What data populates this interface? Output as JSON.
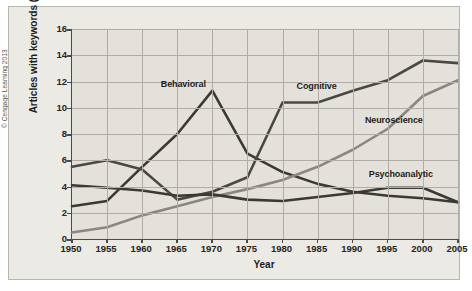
{
  "figure": {
    "copyright": "© Cengage Learning 2013",
    "background_color": "#eceae5",
    "plot_background_color": "#e4e1db",
    "grid_color": "#b0ada7",
    "axis_color": "#4d4a45"
  },
  "chart_data": {
    "type": "line",
    "title": "",
    "xlabel": "Year",
    "ylabel": "Articles with keywords (%)",
    "x": [
      1950,
      1955,
      1960,
      1965,
      1970,
      1975,
      1980,
      1985,
      1990,
      1995,
      2000,
      2005
    ],
    "xlim": [
      1950,
      2005
    ],
    "ylim": [
      0,
      16
    ],
    "yticks": [
      0,
      2,
      4,
      6,
      8,
      10,
      12,
      14,
      16
    ],
    "xticks": [
      1950,
      1955,
      1960,
      1965,
      1970,
      1975,
      1980,
      1985,
      1990,
      1995,
      2000,
      2005
    ],
    "grid": true,
    "legend_position": "inline-annotations",
    "series": [
      {
        "name": "Behavioral",
        "color": "#3b3936",
        "values": [
          2.5,
          2.9,
          5.5,
          8.0,
          11.3,
          6.5,
          5.1,
          4.2,
          3.6,
          3.3,
          3.1,
          2.8
        ],
        "label_x": 1966,
        "label_y": 11.7
      },
      {
        "name": "Cognitive",
        "color": "#4a4845",
        "values": [
          5.5,
          6.0,
          5.3,
          3.0,
          3.6,
          4.7,
          10.4,
          10.4,
          11.3,
          12.1,
          13.6,
          13.4
        ],
        "label_x": 1985,
        "label_y": 11.6
      },
      {
        "name": "Neuroscience",
        "color": "#8a8780",
        "values": [
          0.5,
          0.9,
          1.8,
          2.5,
          3.2,
          3.8,
          4.5,
          5.5,
          6.8,
          8.4,
          10.9,
          12.1
        ],
        "label_x": 1996,
        "label_y": 9.0
      },
      {
        "name": "Psychoanalytic",
        "color": "#3b3936",
        "values": [
          4.1,
          3.9,
          3.7,
          3.3,
          3.4,
          3.0,
          2.9,
          3.2,
          3.5,
          3.9,
          3.9,
          2.8
        ],
        "label_x": 1997,
        "label_y": 4.9
      }
    ]
  }
}
